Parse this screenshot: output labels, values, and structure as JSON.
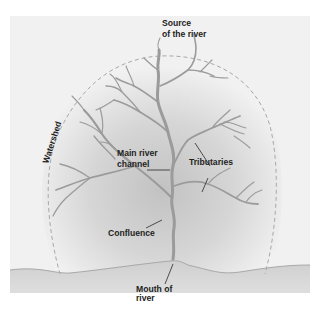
{
  "diagram": {
    "type": "river-system-diagram",
    "colors": {
      "background": "#f1f1f1",
      "watershed_glow": "#c9c9c9",
      "ground": "#d4d4d4",
      "river": "#9b9b9b",
      "watershed_line": "#a8a8a8",
      "label_text": "#1e1e1e",
      "leader_line": "#2a2a2a"
    },
    "labels": {
      "source_line1": "Source",
      "source_line2": "of the river",
      "watershed": "Watershed",
      "main_channel_line1": "Main river",
      "main_channel_line2": "channel",
      "tributaries": "Tributaries",
      "confluence": "Confluence",
      "mouth_line1": "Mouth of",
      "mouth_line2": "river"
    }
  }
}
